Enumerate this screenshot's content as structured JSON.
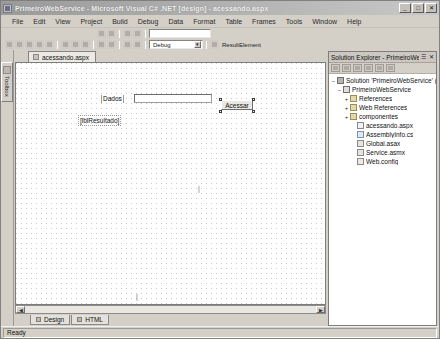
{
  "window": {
    "title": "PrimeiroWebService - Microsoft Visual C# .NET [design] - acessando.aspx",
    "minimize_label": "_",
    "maximize_label": "□",
    "close_label": "✕"
  },
  "menubar": {
    "items": [
      {
        "label": "File"
      },
      {
        "label": "Edit"
      },
      {
        "label": "View"
      },
      {
        "label": "Project"
      },
      {
        "label": "Build"
      },
      {
        "label": "Debug"
      },
      {
        "label": "Data"
      },
      {
        "label": "Format"
      },
      {
        "label": "Table"
      },
      {
        "label": "Frames"
      },
      {
        "label": "Tools"
      },
      {
        "label": "Window"
      },
      {
        "label": "Help"
      }
    ]
  },
  "toolbar": {
    "config_combo": "Debug",
    "target_combo": "ResultElement",
    "find_placeholder": "",
    "find_value": ""
  },
  "left_dock": {
    "toolbox_tab": "Toolbox"
  },
  "document_tabs": [
    {
      "label": "acessando.aspx",
      "active": true
    }
  ],
  "designer": {
    "label_dados": "Dados",
    "textbox_value": "",
    "button_acessar": "Acessar",
    "label_resultado": "[lblResultado]"
  },
  "view_tabs": [
    {
      "label": "Design",
      "active": true
    },
    {
      "label": "HTML",
      "active": false
    }
  ],
  "solution_explorer": {
    "title": "Solution Explorer - PrimeiroWebService",
    "pin_label": "☰",
    "close_label": "✕",
    "toolbar_icons": [
      "refresh-icon",
      "show-all-files-icon",
      "properties-icon",
      "view-code-icon",
      "view-designer-icon",
      "copy-web-icon"
    ],
    "tree": [
      {
        "label": "Solution 'PrimeiroWebService' (1 project)",
        "indent": 0,
        "expander": "−",
        "icon": "solution-icon",
        "kind": "sln"
      },
      {
        "label": "PrimeiroWebService",
        "indent": 1,
        "expander": "−",
        "icon": "project-icon",
        "kind": "proj"
      },
      {
        "label": "References",
        "indent": 2,
        "expander": "+",
        "icon": "folder-icon",
        "kind": "fold"
      },
      {
        "label": "Web References",
        "indent": 2,
        "expander": "+",
        "icon": "folder-icon",
        "kind": "fold"
      },
      {
        "label": "componentes",
        "indent": 2,
        "expander": "+",
        "icon": "folder-icon",
        "kind": "fold"
      },
      {
        "label": "acessando.aspx",
        "indent": 2,
        "expander": "",
        "icon": "web-form-icon",
        "kind": "page"
      },
      {
        "label": "AssemblyInfo.cs",
        "indent": 2,
        "expander": "",
        "icon": "csharp-file-icon",
        "kind": "cs"
      },
      {
        "label": "Global.asax",
        "indent": 2,
        "expander": "",
        "icon": "global-asax-icon",
        "kind": "asax"
      },
      {
        "label": "Service.asmx",
        "indent": 2,
        "expander": "",
        "icon": "web-service-icon",
        "kind": "asax"
      },
      {
        "label": "Web.config",
        "indent": 2,
        "expander": "",
        "icon": "config-file-icon",
        "kind": "cfg"
      }
    ]
  },
  "statusbar": {
    "message": "Ready"
  }
}
